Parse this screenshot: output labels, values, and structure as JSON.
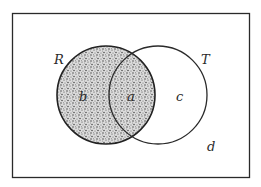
{
  "diagram": {
    "type": "venn",
    "universe": {
      "label": "d"
    },
    "sets": [
      {
        "name": "R",
        "label": "R",
        "shaded": true
      },
      {
        "name": "T",
        "label": "T",
        "shaded": false
      }
    ],
    "regions": [
      {
        "id": "b",
        "label": "b",
        "description": "R only",
        "shaded": true
      },
      {
        "id": "a",
        "label": "a",
        "description": "R and T",
        "shaded": true
      },
      {
        "id": "c",
        "label": "c",
        "description": "T only",
        "shaded": false
      },
      {
        "id": "d",
        "label": "d",
        "description": "outside R and T",
        "shaded": false
      }
    ],
    "colors": {
      "stroke": "#2a2a2a",
      "background": "#ffffff",
      "shade_base": "#d8d8d8",
      "shade_dots": "#3a3a3a"
    }
  }
}
